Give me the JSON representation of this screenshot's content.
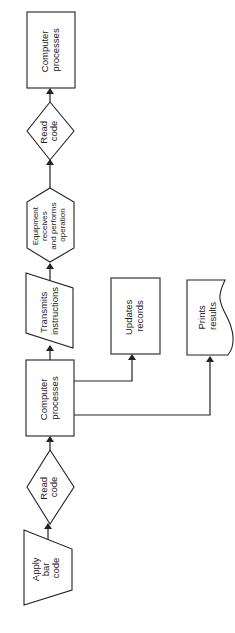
{
  "diagram": {
    "type": "flowchart",
    "orientation": "rotated-90-ccw",
    "nodes": [
      {
        "id": "apply",
        "shape": "manual-operation",
        "lines": [
          "Apply",
          "bar",
          "code"
        ]
      },
      {
        "id": "read1",
        "shape": "decision",
        "lines": [
          "Read",
          "code"
        ]
      },
      {
        "id": "proc1",
        "shape": "process",
        "lines": [
          "Computer",
          "processes"
        ]
      },
      {
        "id": "transmit",
        "shape": "input-output",
        "lines": [
          "Transmits",
          "instructions"
        ]
      },
      {
        "id": "equip",
        "shape": "preparation",
        "lines": [
          "Equipment",
          "receives",
          "and performs",
          "operation"
        ]
      },
      {
        "id": "read2",
        "shape": "decision",
        "lines": [
          "Read",
          "code"
        ]
      },
      {
        "id": "proc2",
        "shape": "process",
        "lines": [
          "Computer",
          "processes"
        ]
      },
      {
        "id": "updates",
        "shape": "process",
        "lines": [
          "Updates",
          "records"
        ]
      },
      {
        "id": "prints",
        "shape": "document",
        "lines": [
          "Prints",
          "results"
        ]
      }
    ],
    "edges": [
      {
        "from": "apply",
        "to": "read1"
      },
      {
        "from": "read1",
        "to": "proc1"
      },
      {
        "from": "proc1",
        "to": "transmit"
      },
      {
        "from": "transmit",
        "to": "equip"
      },
      {
        "from": "equip",
        "to": "read2"
      },
      {
        "from": "read2",
        "to": "proc2"
      },
      {
        "from": "proc1",
        "to": "updates"
      },
      {
        "from": "proc1",
        "to": "prints"
      }
    ]
  }
}
